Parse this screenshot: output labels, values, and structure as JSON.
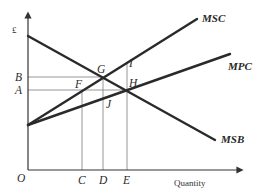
{
  "diagram": {
    "title": "",
    "y_axis_label": "£",
    "x_axis_label": "Quantity",
    "origin_label": "O",
    "curves": [
      {
        "name": "MSC",
        "label": "MSC"
      },
      {
        "name": "MPC",
        "label": "MPC"
      },
      {
        "name": "MSB",
        "label": "MSB"
      }
    ],
    "price_levels": [
      {
        "label": "B"
      },
      {
        "label": "A"
      }
    ],
    "quantity_levels": [
      {
        "label": "C"
      },
      {
        "label": "D"
      },
      {
        "label": "E"
      }
    ],
    "points": [
      {
        "label": "G",
        "description": "MSC meets MSB (social optimum)"
      },
      {
        "label": "H",
        "description": "MPC meets MSB (market equilibrium)"
      },
      {
        "label": "F",
        "description": "MSC at price A"
      },
      {
        "label": "I",
        "description": "MSC at quantity E"
      },
      {
        "label": "J",
        "description": "MPC at quantity D"
      }
    ],
    "colors": {
      "line": "#2a2a2a",
      "guide": "#8a8a8a",
      "background": "#ffffff"
    }
  }
}
